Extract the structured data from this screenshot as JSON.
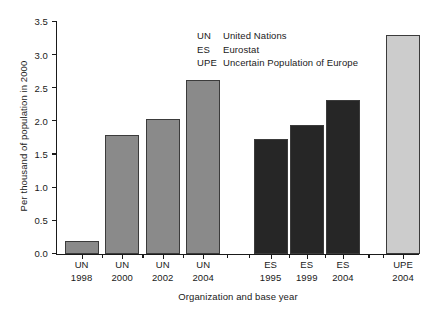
{
  "chart_data": {
    "type": "bar",
    "title": "",
    "xlabel": "Organization and base year",
    "ylabel": "Per thousand of population in 2000",
    "categories": [
      "UN 1998",
      "UN 2000",
      "UN 2002",
      "UN 2004",
      "ES 1995",
      "ES 1999",
      "ES 2004",
      "UPE 2004"
    ],
    "category_lines": [
      {
        "org": "UN",
        "year": "1998"
      },
      {
        "org": "UN",
        "year": "2000"
      },
      {
        "org": "UN",
        "year": "2002"
      },
      {
        "org": "UN",
        "year": "2004"
      },
      {
        "org": "ES",
        "year": "1995"
      },
      {
        "org": "ES",
        "year": "1999"
      },
      {
        "org": "ES",
        "year": "2004"
      },
      {
        "org": "UPE",
        "year": "2004"
      }
    ],
    "values": [
      0.2,
      1.8,
      2.03,
      2.62,
      1.74,
      1.94,
      2.32,
      3.3
    ],
    "bar_colors": [
      "#8a8a8a",
      "#8a8a8a",
      "#8a8a8a",
      "#8a8a8a",
      "#262626",
      "#262626",
      "#262626",
      "#cccccc"
    ],
    "ylim": [
      0.0,
      3.5
    ],
    "ytick_labels": [
      "0.0",
      "0.5",
      "1.0",
      "1.5",
      "2.0",
      "2.5",
      "3.0",
      "3.5"
    ],
    "ytick_values": [
      0.0,
      0.5,
      1.0,
      1.5,
      2.0,
      2.5,
      3.0,
      3.5
    ],
    "grid": false,
    "legend_position": "upper-center"
  },
  "legend": {
    "entries": [
      {
        "abbr": "UN",
        "description": "United Nations"
      },
      {
        "abbr": "ES",
        "description": "Eurostat"
      },
      {
        "abbr": "UPE",
        "description": "Uncertain Population of Europe"
      }
    ]
  }
}
